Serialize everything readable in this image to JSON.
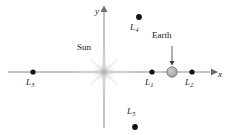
{
  "figure": {
    "width": 229,
    "height": 135,
    "background": "#ffffff"
  },
  "axes": {
    "x_label": "x",
    "y_label": "y",
    "color": "#8c8c8c",
    "origin": {
      "x": 104,
      "y": 72
    },
    "x_start": 8,
    "x_end": 215,
    "y_top": 8,
    "y_bottom": 128
  },
  "bodies": [
    {
      "id": "sun",
      "label": "Sun",
      "kind": "starburst",
      "x": 104,
      "y": 72,
      "color": "#c9c9c9",
      "label_x": 77,
      "label_y": 50
    },
    {
      "id": "earth",
      "label": "Earth",
      "kind": "circle",
      "x": 172,
      "y": 72,
      "radius": 5,
      "fill": "#b0b0b0",
      "stroke": "#6e6e6e",
      "label_x": 152,
      "label_y": 37
    }
  ],
  "lagrange_points": [
    {
      "id": "L3",
      "name": "L",
      "subscript": "3",
      "x": 33,
      "y": 72,
      "label_x": 26,
      "label_y": 79,
      "color": "#1a1a1a"
    },
    {
      "id": "L1",
      "name": "L",
      "subscript": "1",
      "x": 152,
      "y": 72,
      "label_x": 145,
      "label_y": 79,
      "color": "#1a1a1a"
    },
    {
      "id": "L2",
      "name": "L",
      "subscript": "2",
      "x": 192,
      "y": 72,
      "label_x": 185,
      "label_y": 79,
      "color": "#1a1a1a"
    },
    {
      "id": "L4",
      "name": "L",
      "subscript": "4",
      "x": 139,
      "y": 17,
      "label_x": 130,
      "label_y": 24,
      "color": "#1a1a1a"
    },
    {
      "id": "L5",
      "name": "L",
      "subscript": "5",
      "x": 135,
      "y": 127,
      "label_x": 127,
      "label_y": 108,
      "color": "#1a1a1a"
    }
  ],
  "annotations": [
    {
      "id": "earth-pointer",
      "kind": "arrow",
      "from_x": 172,
      "from_y": 46,
      "to_x": 172,
      "to_y": 64,
      "color": "#4d4d4d"
    }
  ]
}
